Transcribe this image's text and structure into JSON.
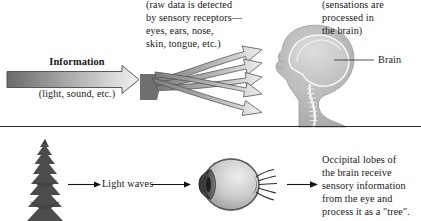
{
  "figure": {
    "background_color": "#ffffff",
    "divider_color": "#2b2b2b"
  },
  "panel_top": {
    "name": "sensation-to-perception",
    "information_label": "Information",
    "information_sublabel": "(light, sound, etc.)",
    "receptors_caption": "(raw data is detected\nby sensory receptors—\neyes, ears, nose,\nskin, tongue, etc.)",
    "perception_caption": "(sensations are\nprocessed in\nthe brain)",
    "perception_heading_clipped": "Perception",
    "brain_label": "Brain",
    "arrow_count": 5,
    "colors": {
      "arrow_dark": "#6e6e6e",
      "arrow_light": "#e8e8e8",
      "outline": "#3a3a3a",
      "head_fill": "#b9b9b9",
      "brain_fill": "#cfcfcf"
    }
  },
  "panel_bottom": {
    "name": "vision-example",
    "tree_label": "evergreen tree",
    "light_waves_label": "Light waves",
    "occipital_caption": "Occipital lobes of\nthe brain receive\nsensory information\nfrom the eye and\nprocess it as a \"tree\".",
    "colors": {
      "tree_fill": "#4a4a4a",
      "eye_fill": "#c9c9c9",
      "eye_outline": "#3a3a3a",
      "arrow_color": "#1a1a1a"
    }
  }
}
